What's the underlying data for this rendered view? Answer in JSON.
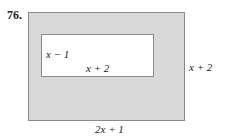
{
  "problem": {
    "number": "76.",
    "inner_rect": {
      "side_label": "x − 1",
      "bottom_label": "x + 2"
    },
    "outer_rect": {
      "side_label": "x + 2",
      "bottom_label": "2x + 1"
    },
    "colors": {
      "shaded": "#d9d9d9",
      "border": "#8a8a8a",
      "inner": "#ffffff"
    }
  }
}
